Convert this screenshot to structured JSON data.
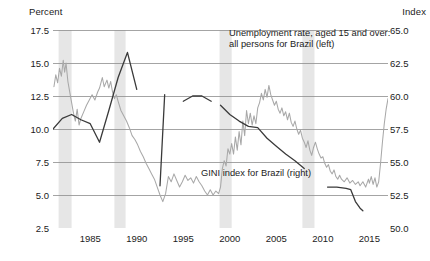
{
  "chart_data": {
    "type": "line",
    "title": "",
    "xlabel": "",
    "ylabel": "Percent",
    "y2label": "Index",
    "xlim": [
      1981,
      2017
    ],
    "ylim": [
      2.5,
      17.5
    ],
    "y2lim": [
      50.0,
      65.0
    ],
    "grid": true,
    "legend_position": "inline-annotations",
    "x_ticks": [
      "1985",
      "1990",
      "1995",
      "2000",
      "2005",
      "2010",
      "2015"
    ],
    "x_tick_values": [
      1985,
      1990,
      1995,
      2000,
      2005,
      2010,
      2015
    ],
    "y_ticks_left": [
      "2.5",
      "5.0",
      "7.5",
      "10.0",
      "12.5",
      "15.0",
      "17.5"
    ],
    "y_tick_values_left": [
      2.5,
      5.0,
      7.5,
      10.0,
      12.5,
      15.0,
      17.5
    ],
    "y_ticks_right": [
      "50.0",
      "52.5",
      "55.0",
      "57.5",
      "60.0",
      "62.5",
      "65.0"
    ],
    "y_tick_values_right": [
      50.0,
      52.5,
      55.0,
      57.5,
      60.0,
      62.5,
      65.0
    ],
    "recession_bands": [
      {
        "start": 1981.6,
        "end": 1983.0
      },
      {
        "start": 1987.6,
        "end": 1988.8
      },
      {
        "start": 1998.9,
        "end": 2000.2
      },
      {
        "start": 2007.8,
        "end": 2009.1
      }
    ],
    "recession_band_color": "#e6e6e6",
    "series": [
      {
        "name": "Unemployment rate, aged 15 and over: all persons for Brazil (left)",
        "axis": "left",
        "color": "#a8a8a8",
        "units": "Percent",
        "points": [
          [
            1981.1,
            13.2
          ],
          [
            1981.3,
            14.1
          ],
          [
            1981.5,
            13.5
          ],
          [
            1981.7,
            14.6
          ],
          [
            1981.9,
            14.0
          ],
          [
            1982.1,
            15.2
          ],
          [
            1982.25,
            14.3
          ],
          [
            1982.4,
            15.0
          ],
          [
            1982.6,
            13.6
          ],
          [
            1982.8,
            12.8
          ],
          [
            1983.0,
            12.0
          ],
          [
            1983.2,
            11.2
          ],
          [
            1983.4,
            10.6
          ],
          [
            1983.6,
            11.5
          ],
          [
            1983.8,
            10.3
          ],
          [
            1984.0,
            10.8
          ],
          [
            1984.3,
            11.3
          ],
          [
            1984.6,
            11.8
          ],
          [
            1984.9,
            12.2
          ],
          [
            1985.2,
            12.6
          ],
          [
            1985.5,
            12.2
          ],
          [
            1985.8,
            12.8
          ],
          [
            1986.0,
            13.1
          ],
          [
            1986.3,
            13.9
          ],
          [
            1986.5,
            13.2
          ],
          [
            1986.8,
            13.7
          ],
          [
            1987.0,
            13.1
          ],
          [
            1987.2,
            13.6
          ],
          [
            1987.4,
            12.8
          ],
          [
            1987.6,
            12.3
          ],
          [
            1987.8,
            12.6
          ],
          [
            1988.0,
            12.1
          ],
          [
            1988.3,
            11.4
          ],
          [
            1988.6,
            11.0
          ],
          [
            1988.9,
            10.6
          ],
          [
            1989.2,
            10.1
          ],
          [
            1989.5,
            9.5
          ],
          [
            1989.8,
            9.2
          ],
          [
            1990.1,
            8.8
          ],
          [
            1990.4,
            8.3
          ],
          [
            1990.7,
            7.9
          ],
          [
            1991.0,
            7.4
          ],
          [
            1991.3,
            7.0
          ],
          [
            1991.6,
            6.6
          ],
          [
            1991.9,
            6.2
          ],
          [
            1992.2,
            5.6
          ],
          [
            1992.5,
            5.0
          ],
          [
            1992.8,
            4.5
          ],
          [
            1993.1,
            5.1
          ],
          [
            1993.4,
            6.4
          ],
          [
            1993.7,
            6.0
          ],
          [
            1994.0,
            6.6
          ],
          [
            1994.3,
            6.1
          ],
          [
            1994.6,
            5.6
          ],
          [
            1994.9,
            6.0
          ],
          [
            1995.2,
            6.5
          ],
          [
            1995.5,
            6.1
          ],
          [
            1995.8,
            6.3
          ],
          [
            1996.1,
            5.9
          ],
          [
            1996.4,
            6.4
          ],
          [
            1996.7,
            6.0
          ],
          [
            1997.0,
            5.7
          ],
          [
            1997.3,
            5.3
          ],
          [
            1997.6,
            5.0
          ],
          [
            1997.9,
            5.4
          ],
          [
            1998.2,
            5.0
          ],
          [
            1998.5,
            5.3
          ],
          [
            1998.8,
            5.1
          ],
          [
            1999.0,
            5.6
          ],
          [
            1999.2,
            7.0
          ],
          [
            1999.4,
            7.6
          ],
          [
            1999.6,
            7.2
          ],
          [
            1999.8,
            8.5
          ],
          [
            2000.0,
            8.1
          ],
          [
            2000.2,
            8.9
          ],
          [
            2000.4,
            8.1
          ],
          [
            2000.6,
            9.4
          ],
          [
            2000.8,
            8.4
          ],
          [
            2001.0,
            9.8
          ],
          [
            2001.2,
            8.8
          ],
          [
            2001.4,
            10.6
          ],
          [
            2001.6,
            9.5
          ],
          [
            2001.8,
            11.4
          ],
          [
            2002.0,
            10.4
          ],
          [
            2002.2,
            11.2
          ],
          [
            2002.4,
            10.3
          ],
          [
            2002.6,
            11.0
          ],
          [
            2002.8,
            10.4
          ],
          [
            2003.0,
            11.6
          ],
          [
            2003.2,
            12.0
          ],
          [
            2003.4,
            12.7
          ],
          [
            2003.6,
            12.2
          ],
          [
            2003.8,
            13.0
          ],
          [
            2004.0,
            12.4
          ],
          [
            2004.2,
            13.3
          ],
          [
            2004.4,
            12.6
          ],
          [
            2004.6,
            12.2
          ],
          [
            2004.8,
            11.8
          ],
          [
            2005.0,
            12.1
          ],
          [
            2005.2,
            11.5
          ],
          [
            2005.4,
            11.2
          ],
          [
            2005.6,
            11.6
          ],
          [
            2005.8,
            11.0
          ],
          [
            2006.0,
            11.3
          ],
          [
            2006.2,
            10.7
          ],
          [
            2006.4,
            11.2
          ],
          [
            2006.6,
            10.5
          ],
          [
            2006.8,
            10.2
          ],
          [
            2007.0,
            10.6
          ],
          [
            2007.2,
            10.0
          ],
          [
            2007.4,
            9.6
          ],
          [
            2007.6,
            9.9
          ],
          [
            2007.8,
            9.3
          ],
          [
            2008.0,
            9.0
          ],
          [
            2008.2,
            8.6
          ],
          [
            2008.4,
            9.1
          ],
          [
            2008.6,
            8.4
          ],
          [
            2008.8,
            8.0
          ],
          [
            2009.0,
            8.6
          ],
          [
            2009.2,
            9.0
          ],
          [
            2009.4,
            8.5
          ],
          [
            2009.6,
            8.1
          ],
          [
            2009.8,
            7.8
          ],
          [
            2010.0,
            7.9
          ],
          [
            2010.2,
            7.4
          ],
          [
            2010.4,
            7.1
          ],
          [
            2010.6,
            7.3
          ],
          [
            2010.8,
            6.8
          ],
          [
            2011.0,
            6.6
          ],
          [
            2011.2,
            6.9
          ],
          [
            2011.4,
            6.4
          ],
          [
            2011.6,
            6.2
          ],
          [
            2011.8,
            6.5
          ],
          [
            2012.0,
            6.2
          ],
          [
            2012.3,
            6.0
          ],
          [
            2012.6,
            6.3
          ],
          [
            2012.9,
            5.9
          ],
          [
            2013.2,
            6.1
          ],
          [
            2013.5,
            5.8
          ],
          [
            2013.8,
            6.0
          ],
          [
            2014.0,
            5.7
          ],
          [
            2014.3,
            6.0
          ],
          [
            2014.6,
            5.6
          ],
          [
            2014.9,
            6.2
          ],
          [
            2015.0,
            5.9
          ],
          [
            2015.2,
            6.4
          ],
          [
            2015.4,
            5.8
          ],
          [
            2015.6,
            6.3
          ],
          [
            2015.8,
            5.6
          ],
          [
            2016.0,
            6.0
          ],
          [
            2016.2,
            7.4
          ],
          [
            2016.4,
            9.0
          ],
          [
            2016.6,
            10.4
          ],
          [
            2016.8,
            11.5
          ],
          [
            2017.0,
            12.3
          ]
        ]
      },
      {
        "name": "GINI index for Brazil (right)",
        "axis": "right",
        "color": "#3a3a3a",
        "units": "Index",
        "segments": [
          {
            "points": [
              [
                1981.0,
                57.5
              ],
              [
                1982.0,
                58.3
              ],
              [
                1983.0,
                58.6
              ],
              [
                1984.0,
                58.2
              ],
              [
                1985.0,
                57.9
              ],
              [
                1986.0,
                56.5
              ],
              [
                1987.0,
                58.9
              ],
              [
                1988.0,
                61.4
              ],
              [
                1989.0,
                63.3
              ],
              [
                1990.0,
                60.5
              ]
            ]
          },
          {
            "points": [
              [
                1992.5,
                53.2
              ],
              [
                1993.0,
                60.1
              ]
            ]
          },
          {
            "points": [
              [
                1995.0,
                59.6
              ],
              [
                1996.0,
                60.0
              ],
              [
                1997.0,
                60.0
              ],
              [
                1998.0,
                59.6
              ]
            ]
          },
          {
            "points": [
              [
                1999.0,
                59.3
              ],
              [
                2000.0,
                58.6
              ],
              [
                2001.0,
                58.1
              ],
              [
                2002.0,
                57.7
              ],
              [
                2003.0,
                57.6
              ],
              [
                2004.0,
                56.8
              ],
              [
                2005.0,
                56.2
              ],
              [
                2006.0,
                55.6
              ],
              [
                2007.0,
                55.1
              ],
              [
                2008.0,
                54.5
              ]
            ]
          },
          {
            "points": [
              [
                2010.5,
                53.1
              ],
              [
                2011.5,
                53.1
              ],
              [
                2012.5,
                53.0
              ],
              [
                2013.0,
                52.9
              ],
              [
                2013.5,
                52.0
              ],
              [
                2014.0,
                51.5
              ],
              [
                2014.3,
                51.3
              ]
            ]
          }
        ]
      }
    ]
  },
  "axes": {
    "left_title": "Percent",
    "right_title": "Index"
  },
  "annotations": {
    "unemployment_line1": "Unemployment rate, aged 15 and over:",
    "unemployment_line2": "all persons for Brazil (left)",
    "gini": "GINI index for Brazil (right)"
  }
}
